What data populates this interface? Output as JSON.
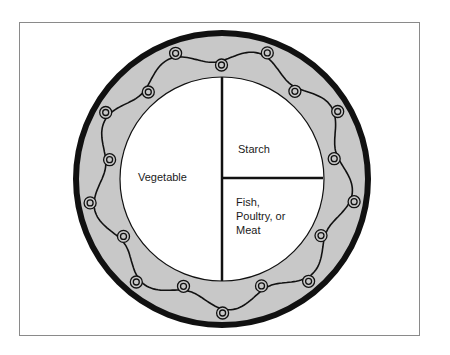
{
  "diagram": {
    "sections": [
      {
        "id": "vegetable",
        "label": "Vegetable",
        "portion": "half"
      },
      {
        "id": "starch",
        "label": "Starch",
        "portion": "quarter"
      },
      {
        "id": "protein",
        "label_lines": [
          "Fish,",
          "Poultry, or",
          "Meat"
        ],
        "portion": "quarter"
      }
    ],
    "colors": {
      "rim_fill": "#c8c8c8",
      "rim_border": "#111111",
      "plate_center": "#ffffff",
      "divider": "#111111",
      "frame_border": "#8a8a8a"
    },
    "rim_decoration": {
      "type": "wavy-line-with-double-circles",
      "circle_count": 18
    }
  }
}
